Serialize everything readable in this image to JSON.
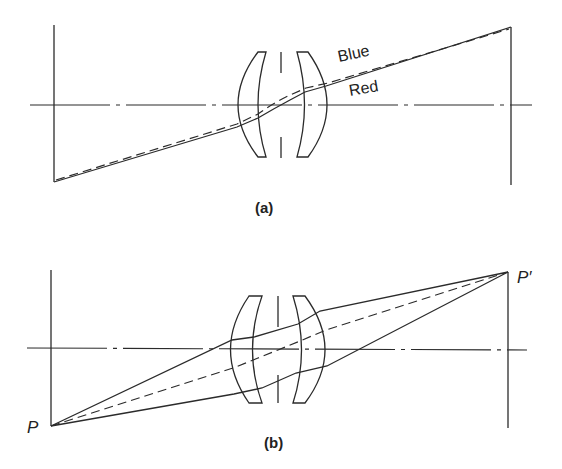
{
  "figure_a": {
    "caption": "(a)",
    "labels": {
      "blue": "Blue",
      "red": "Red"
    }
  },
  "figure_b": {
    "caption": "(b)",
    "labels": {
      "object_point": "P",
      "image_point": "P′"
    }
  },
  "colors": {
    "stroke": "#2b2b2b",
    "background": "#ffffff"
  }
}
